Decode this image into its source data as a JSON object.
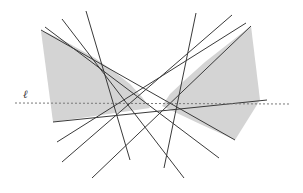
{
  "diagram": {
    "label_line": "ℓ",
    "colors": {
      "shade": "#d4d4d4",
      "line": "#3a3a3a",
      "dashed": "#777777"
    },
    "regions": [
      {
        "name": "left-shaded-region",
        "points": [
          [
            41,
            31
          ],
          [
            48,
            33
          ],
          [
            70,
            44
          ],
          [
            95,
            58
          ],
          [
            112,
            70
          ],
          [
            130,
            84
          ],
          [
            142,
            97
          ],
          [
            150,
            108
          ],
          [
            53,
            122
          ]
        ]
      },
      {
        "name": "right-shaded-region",
        "points": [
          [
            251,
            26
          ],
          [
            260,
            100
          ],
          [
            235,
            140
          ],
          [
            200,
            124
          ],
          [
            162,
            106
          ],
          [
            170,
            94
          ],
          [
            185,
            80
          ],
          [
            205,
            62
          ],
          [
            228,
            44
          ]
        ]
      }
    ],
    "lines": [
      {
        "name": "line-1",
        "from": [
          41,
          30
        ],
        "to": [
          235,
          140
        ]
      },
      {
        "name": "line-2",
        "from": [
          45,
          27
        ],
        "to": [
          219,
          158
        ]
      },
      {
        "name": "line-3",
        "from": [
          62,
          19
        ],
        "to": [
          184,
          178
        ]
      },
      {
        "name": "line-4",
        "from": [
          86,
          11
        ],
        "to": [
          130,
          160
        ]
      },
      {
        "name": "line-5",
        "from": [
          196,
          13
        ],
        "to": [
          164,
          168
        ]
      },
      {
        "name": "line-6",
        "from": [
          232,
          15
        ],
        "to": [
          62,
          162
        ]
      },
      {
        "name": "line-7",
        "from": [
          246,
          23
        ],
        "to": [
          57,
          142
        ]
      },
      {
        "name": "line-8",
        "from": [
          251,
          26
        ],
        "to": [
          92,
          178
        ]
      },
      {
        "name": "line-9",
        "from": [
          53,
          122
        ],
        "to": [
          267,
          100
        ]
      }
    ],
    "dashed_line": {
      "name": "line-ell",
      "from": [
        15,
        103
      ],
      "to": [
        290,
        104
      ]
    }
  }
}
